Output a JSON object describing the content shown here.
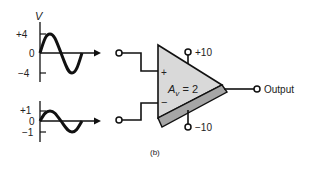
{
  "figure": {
    "caption": "(b)",
    "colors": {
      "ink": "#111111",
      "amp_fill": "#d9d9d9",
      "amp_band": "#a6a6a6",
      "background": "#ffffff"
    }
  },
  "input_top": {
    "axis_label": "V",
    "ticks": [
      "+4",
      "0",
      "−4"
    ],
    "amplitude": 4,
    "waveform": "sine"
  },
  "input_bottom": {
    "ticks": [
      "+1",
      "0",
      "−1"
    ],
    "amplitude": 1,
    "waveform": "sine"
  },
  "amplifier": {
    "gain_symbol": "A",
    "gain_subscript": "v",
    "gain_rest": " = 2",
    "plus_input": "+",
    "minus_input": "−",
    "supply_pos": "+10",
    "supply_neg": "−10"
  },
  "output": {
    "label": "Output"
  }
}
